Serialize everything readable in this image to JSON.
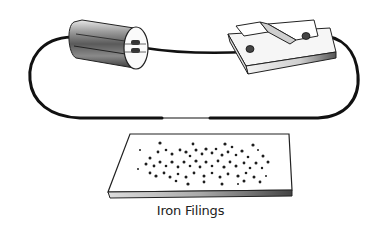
{
  "diagram": {
    "caption": "Iron Filings",
    "components": [
      {
        "name": "battery-cell",
        "description": "cylindrical dry cell with terminals"
      },
      {
        "name": "tap-key-switch",
        "description": "switch key on a base block"
      },
      {
        "name": "wire-loop",
        "description": "conducting wire connecting cell and switch, passing over the iron filings"
      },
      {
        "name": "iron-filings-board",
        "description": "flat board with scattered iron filings"
      }
    ],
    "colors": {
      "wire": "#111111",
      "outline": "#1a1a1a",
      "filings": "#1e1e1e"
    }
  }
}
